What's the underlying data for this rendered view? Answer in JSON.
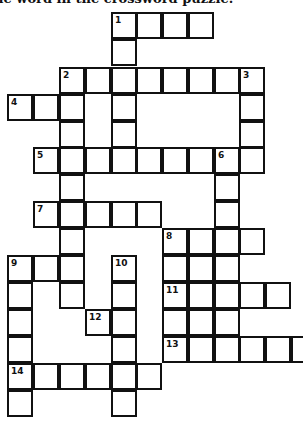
{
  "instructions": "he word in the crossword puzzle.",
  "grid": {
    "col_x": [
      8,
      34,
      60,
      86,
      112,
      137,
      163,
      189,
      215,
      240,
      266,
      292
    ],
    "row_y": [
      13,
      40,
      68,
      95,
      122,
      148,
      175,
      202,
      229,
      256,
      283,
      310,
      337,
      364,
      391
    ],
    "cells": [
      {
        "r": 0,
        "c": 4,
        "n": "1"
      },
      {
        "r": 0,
        "c": 5
      },
      {
        "r": 0,
        "c": 6
      },
      {
        "r": 0,
        "c": 7
      },
      {
        "r": 1,
        "c": 4
      },
      {
        "r": 2,
        "c": 2,
        "n": "2"
      },
      {
        "r": 2,
        "c": 3
      },
      {
        "r": 2,
        "c": 4
      },
      {
        "r": 2,
        "c": 5
      },
      {
        "r": 2,
        "c": 6
      },
      {
        "r": 2,
        "c": 7
      },
      {
        "r": 2,
        "c": 8
      },
      {
        "r": 2,
        "c": 9,
        "n": "3"
      },
      {
        "r": 3,
        "c": 0,
        "n": "4"
      },
      {
        "r": 3,
        "c": 1
      },
      {
        "r": 3,
        "c": 2
      },
      {
        "r": 3,
        "c": 4
      },
      {
        "r": 3,
        "c": 9
      },
      {
        "r": 4,
        "c": 2
      },
      {
        "r": 4,
        "c": 4
      },
      {
        "r": 4,
        "c": 9
      },
      {
        "r": 5,
        "c": 1,
        "n": "5"
      },
      {
        "r": 5,
        "c": 2
      },
      {
        "r": 5,
        "c": 3
      },
      {
        "r": 5,
        "c": 4
      },
      {
        "r": 5,
        "c": 5
      },
      {
        "r": 5,
        "c": 6
      },
      {
        "r": 5,
        "c": 7
      },
      {
        "r": 5,
        "c": 8,
        "n": "6"
      },
      {
        "r": 5,
        "c": 9
      },
      {
        "r": 6,
        "c": 2
      },
      {
        "r": 6,
        "c": 8
      },
      {
        "r": 7,
        "c": 1,
        "n": "7"
      },
      {
        "r": 7,
        "c": 2
      },
      {
        "r": 7,
        "c": 3
      },
      {
        "r": 7,
        "c": 4
      },
      {
        "r": 7,
        "c": 5
      },
      {
        "r": 7,
        "c": 8
      },
      {
        "r": 8,
        "c": 2
      },
      {
        "r": 8,
        "c": 6,
        "n": "8"
      },
      {
        "r": 8,
        "c": 7
      },
      {
        "r": 8,
        "c": 8
      },
      {
        "r": 8,
        "c": 9
      },
      {
        "r": 9,
        "c": 0,
        "n": "9"
      },
      {
        "r": 9,
        "c": 1
      },
      {
        "r": 9,
        "c": 2
      },
      {
        "r": 9,
        "c": 4,
        "n": "10"
      },
      {
        "r": 9,
        "c": 6
      },
      {
        "r": 9,
        "c": 7
      },
      {
        "r": 9,
        "c": 8
      },
      {
        "r": 10,
        "c": 0
      },
      {
        "r": 10,
        "c": 2
      },
      {
        "r": 10,
        "c": 4
      },
      {
        "r": 10,
        "c": 6,
        "n": "11"
      },
      {
        "r": 10,
        "c": 7
      },
      {
        "r": 10,
        "c": 8
      },
      {
        "r": 10,
        "c": 9
      },
      {
        "r": 10,
        "c": 10
      },
      {
        "r": 11,
        "c": 0
      },
      {
        "r": 11,
        "c": 3,
        "n": "12"
      },
      {
        "r": 11,
        "c": 4
      },
      {
        "r": 11,
        "c": 6
      },
      {
        "r": 11,
        "c": 7
      },
      {
        "r": 11,
        "c": 8
      },
      {
        "r": 12,
        "c": 0
      },
      {
        "r": 12,
        "c": 4
      },
      {
        "r": 12,
        "c": 6,
        "n": "13"
      },
      {
        "r": 12,
        "c": 7
      },
      {
        "r": 12,
        "c": 8
      },
      {
        "r": 12,
        "c": 9
      },
      {
        "r": 12,
        "c": 10
      },
      {
        "r": 12,
        "c": 11
      },
      {
        "r": 13,
        "c": 0,
        "n": "14"
      },
      {
        "r": 13,
        "c": 1
      },
      {
        "r": 13,
        "c": 2
      },
      {
        "r": 13,
        "c": 3
      },
      {
        "r": 13,
        "c": 4
      },
      {
        "r": 13,
        "c": 5
      },
      {
        "r": 14,
        "c": 0
      },
      {
        "r": 14,
        "c": 4
      }
    ]
  },
  "clue_numbers": [
    "1",
    "2",
    "3",
    "4",
    "5",
    "6",
    "7",
    "8",
    "9",
    "10",
    "11",
    "12",
    "13",
    "14"
  ]
}
